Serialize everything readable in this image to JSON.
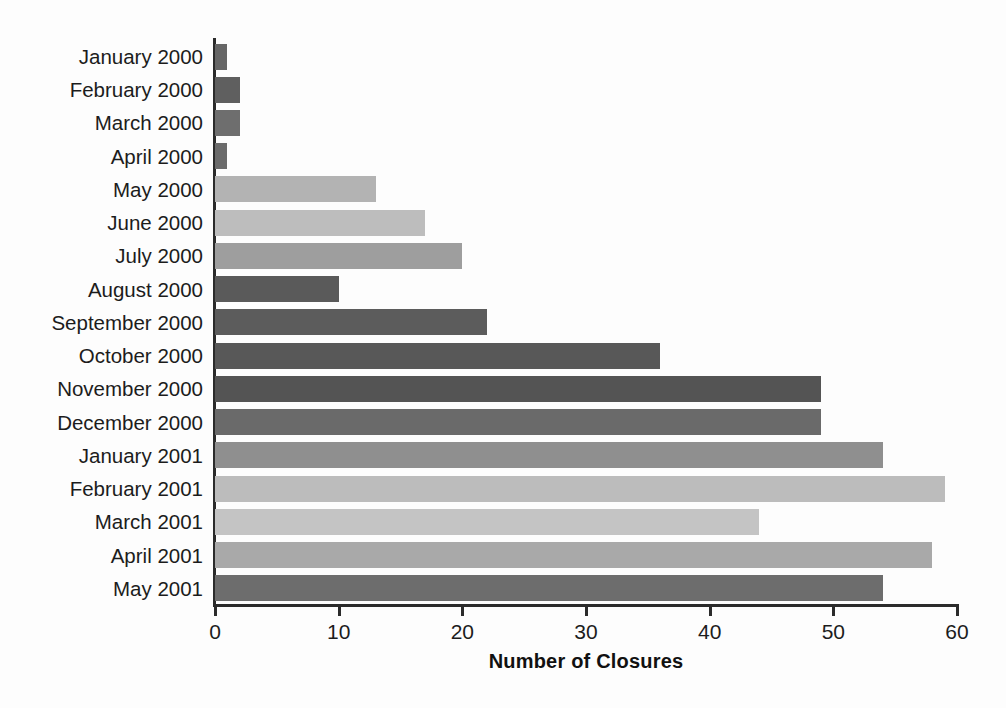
{
  "chart_data": {
    "type": "bar",
    "orientation": "horizontal",
    "title": "",
    "xlabel": "Number of Closures",
    "ylabel": "",
    "xlim": [
      0,
      60
    ],
    "xticks": [
      0,
      10,
      20,
      30,
      40,
      50,
      60
    ],
    "grid": false,
    "legend": null,
    "categories": [
      "January 2000",
      "February 2000",
      "March 2000",
      "April 2000",
      "May 2000",
      "June 2000",
      "July 2000",
      "August 2000",
      "September 2000",
      "October 2000",
      "November 2000",
      "December 2000",
      "January 2001",
      "February 2001",
      "March 2001",
      "April 2001",
      "May 2001"
    ],
    "values": [
      1,
      2,
      2,
      1,
      13,
      17,
      20,
      10,
      22,
      36,
      49,
      49,
      54,
      59,
      44,
      58,
      54
    ],
    "bar_colors": [
      "#666666",
      "#5f5f5f",
      "#6e6e6e",
      "#6b6b6b",
      "#b3b3b3",
      "#bdbdbd",
      "#9e9e9e",
      "#5a5a5a",
      "#5c5c5c",
      "#585858",
      "#545454",
      "#6a6a6a",
      "#8f8f8f",
      "#bcbcbc",
      "#c4c4c4",
      "#a9a9a9",
      "#6d6d6d"
    ]
  },
  "axis": {
    "tick_labels": [
      "0",
      "10",
      "20",
      "30",
      "40",
      "50",
      "60"
    ]
  }
}
